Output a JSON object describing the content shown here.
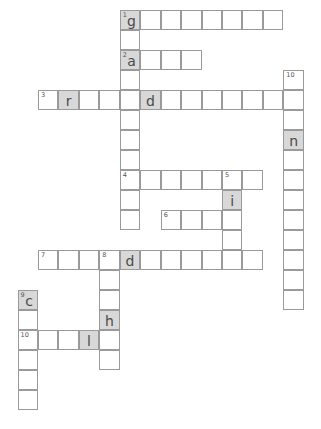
{
  "puzzle": {
    "type": "crossword",
    "grid_origin": {
      "x": 18,
      "y": 10
    },
    "cell_size": {
      "w": 20.45,
      "h": 20.05
    },
    "colors": {
      "border": "#9a9a9a",
      "cell": "#ffffff",
      "shaded": "#d8d8d8",
      "text": "#4a4a4a"
    },
    "entries": [
      {
        "number": "1",
        "direction": "across",
        "row": 0,
        "col": 5,
        "length": 8,
        "letters": {
          "0": "g"
        }
      },
      {
        "number": "1",
        "direction": "down",
        "row": 0,
        "col": 5,
        "length": 11,
        "letters": {
          "0": "g",
          "2": "a"
        }
      },
      {
        "number": "2",
        "direction": "across",
        "row": 2,
        "col": 5,
        "length": 4,
        "letters": {
          "0": "a"
        }
      },
      {
        "number": "3",
        "direction": "across",
        "row": 4,
        "col": 1,
        "length": 13,
        "letters": {
          "1": "r",
          "5": "d"
        }
      },
      {
        "number": "10",
        "direction": "down",
        "row": 3,
        "col": 13,
        "length": 12,
        "letters": {
          "3": "n"
        }
      },
      {
        "number": "4",
        "direction": "across",
        "row": 8,
        "col": 5,
        "length": 7,
        "letters": {}
      },
      {
        "number": "5",
        "direction": "down",
        "row": 8,
        "col": 10,
        "length": 5,
        "letters": {
          "1": "i"
        }
      },
      {
        "number": "6",
        "direction": "across",
        "row": 10,
        "col": 7,
        "length": 4,
        "letters": {}
      },
      {
        "number": "7",
        "direction": "across",
        "row": 12,
        "col": 1,
        "length": 11,
        "letters": {
          "4": "d"
        }
      },
      {
        "number": "8",
        "direction": "down",
        "row": 12,
        "col": 4,
        "length": 6,
        "letters": {
          "3": "h"
        }
      },
      {
        "number": "9",
        "direction": "down",
        "row": 14,
        "col": 0,
        "length": 6,
        "letters": {
          "0": "c"
        }
      },
      {
        "number": "10",
        "direction": "across",
        "row": 16,
        "col": 0,
        "length": 5,
        "letters": {
          "3": "l"
        }
      }
    ]
  }
}
